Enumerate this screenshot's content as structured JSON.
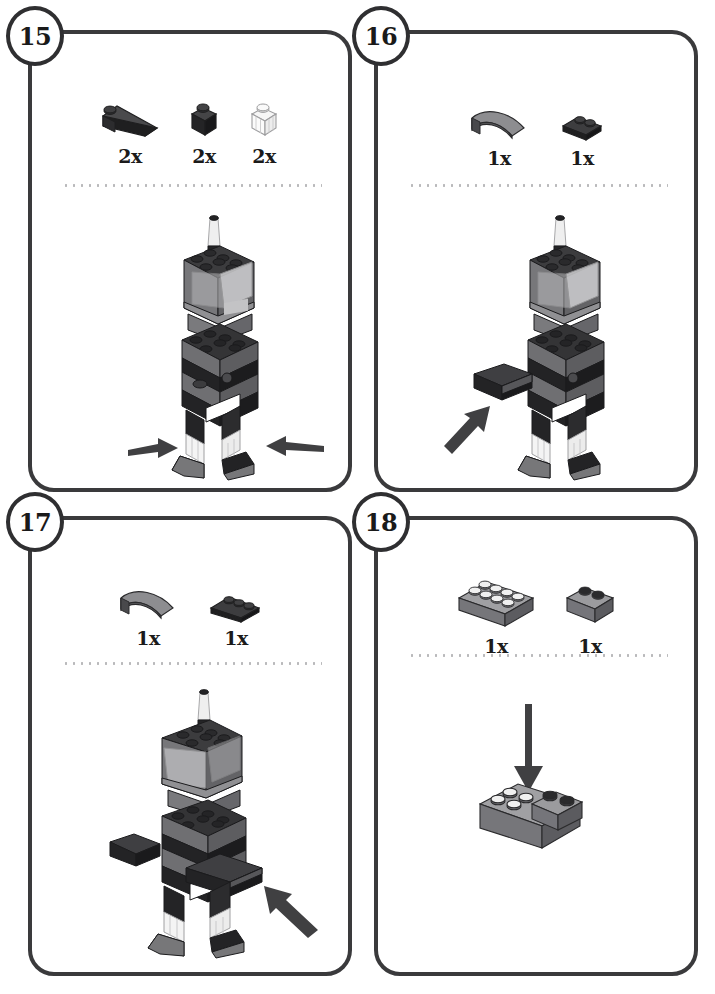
{
  "document": {
    "kind": "lego-building-instructions",
    "page_background": "#ffffff",
    "panel_border_color": "#3a3a3c",
    "divider_color": "#b9b9bb"
  },
  "palette": {
    "black_top": "#3b3b3d",
    "black_front": "#1f1f20",
    "black_side": "#2c2c2e",
    "grey_top": "#9a9a9c",
    "grey_front": "#6e6e70",
    "grey_side": "#808082",
    "clear_top": "#f2f2f2",
    "clear_front": "#e4e4e4",
    "clear_side": "#d2d2d2",
    "arrow": "#404042",
    "outline": "#2a2a2c"
  },
  "steps": [
    {
      "id": "step-15",
      "number": "15",
      "parts": [
        {
          "name": "black-slope-1x3",
          "qty": "2x",
          "icon": "slope-black",
          "color": "#1f1f20"
        },
        {
          "name": "black-brick-1x1",
          "qty": "2x",
          "icon": "brick-1x1-black",
          "color": "#1f1f20"
        },
        {
          "name": "clear-brick-1x1",
          "qty": "2x",
          "icon": "brick-1x1-clear",
          "color": "#e4e4e4"
        }
      ],
      "model": {
        "name": "robot-with-feet",
        "description": "Tall blocky robot torso with transparent antenna; two arrows point inward at the transparent lower-leg bricks",
        "arrows": [
          {
            "name": "arrow-left-foot",
            "direction": "right"
          },
          {
            "name": "arrow-right-foot",
            "direction": "left"
          }
        ]
      }
    },
    {
      "id": "step-16",
      "number": "16",
      "parts": [
        {
          "name": "grey-curved-slope-1x3",
          "qty": "1x",
          "icon": "curved-slope-grey",
          "color": "#6e6e70"
        },
        {
          "name": "black-plate-1x2",
          "qty": "1x",
          "icon": "plate-1x2-black",
          "color": "#1f1f20"
        }
      ],
      "model": {
        "name": "robot-with-left-arm",
        "description": "Robot gains its left arm; one arrow points up-right at the new arm",
        "arrows": [
          {
            "name": "arrow-left-arm",
            "direction": "up-right"
          }
        ]
      }
    },
    {
      "id": "step-17",
      "number": "17",
      "parts": [
        {
          "name": "grey-curved-slope-1x3",
          "qty": "1x",
          "icon": "curved-slope-grey",
          "color": "#6e6e70"
        },
        {
          "name": "black-plate-1x3",
          "qty": "1x",
          "icon": "plate-1x3-black",
          "color": "#1f1f20"
        }
      ],
      "model": {
        "name": "robot-with-both-arms",
        "description": "Robot gains its right arm; one arrow points up-left at the new arm",
        "arrows": [
          {
            "name": "arrow-right-arm",
            "direction": "up-left"
          }
        ]
      }
    },
    {
      "id": "step-18",
      "number": "18",
      "parts": [
        {
          "name": "grey-brick-2x4",
          "qty": "1x",
          "icon": "brick-2x4-grey",
          "color": "#6e6e70"
        },
        {
          "name": "grey-brick-1x2",
          "qty": "1x",
          "icon": "brick-1x2-grey",
          "color": "#6e6e70"
        }
      ],
      "model": {
        "name": "subassembly-2x4-plus-1x2",
        "description": "Grey 1x2 brick being pressed down onto the right end of a grey 2x4 brick",
        "arrows": [
          {
            "name": "arrow-press-down",
            "direction": "down"
          }
        ]
      }
    }
  ]
}
